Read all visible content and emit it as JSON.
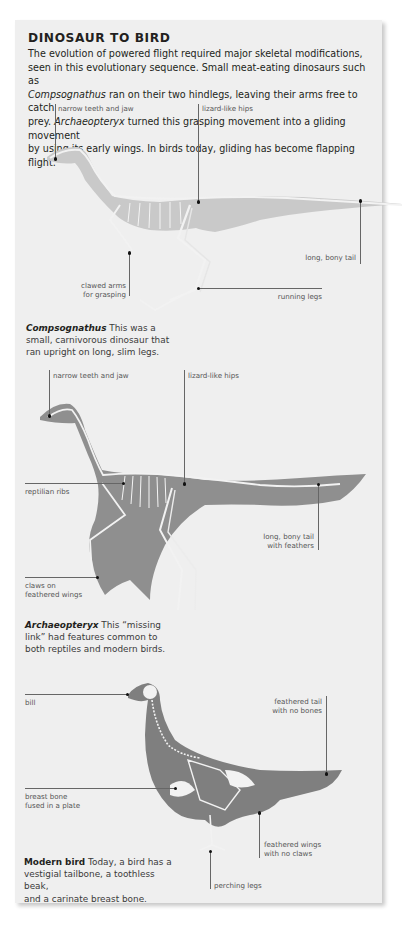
{
  "document": {
    "title": "DINOSAUR TO BIRD",
    "intro": {
      "line1": "The evolution of powered flight required major skeletal modifications,",
      "line2": "seen in this evolutionary sequence. Small meat-eating dinosaurs such as",
      "line3_italic": "Compsognathus",
      "line3_rest": " ran on their two hindlegs, leaving their arms free to catch",
      "line4_pre": "prey. ",
      "line4_italic": "Archaeopteryx",
      "line4_rest": " turned this grasping movement into a gliding movement",
      "line5": "by using its early wings. In birds today, gliding has become flapping flight."
    },
    "colors": {
      "panel_background": "#efefef",
      "compsognathus_body": "#c9c9c9",
      "archaeopteryx_body": "#8f8f8f",
      "modern_bird_body": "#7f7f7f",
      "bone": "#f2f2f2",
      "leader_line": "#666666"
    }
  },
  "compsognathus": {
    "labels": {
      "jaw": "narrow teeth and jaw",
      "hips": "lizard-like hips",
      "tail": "long, bony tail",
      "arms_1": "clawed arms",
      "arms_2": "for grasping",
      "legs": "running legs"
    },
    "caption": {
      "name": "Compsognathus",
      "line1_rest": " This was a",
      "line2": "small, carnivorous dinosaur that",
      "line3": "ran upright on long, slim legs."
    }
  },
  "archaeopteryx": {
    "labels": {
      "jaw": "narrow teeth and jaw",
      "hips": "lizard-like hips",
      "ribs": "reptilian ribs",
      "tail_1": "long, bony tail",
      "tail_2": "with feathers",
      "claws_1": "claws on",
      "claws_2": "feathered wings"
    },
    "caption": {
      "name": "Archaeopteryx",
      "line1_rest": " This “missing",
      "line2": "link” had features common to",
      "line3": "both reptiles and modern birds."
    }
  },
  "modern_bird": {
    "labels": {
      "bill": "bill",
      "tail_1": "feathered tail",
      "tail_2": "with no bones",
      "breast_1": "breast bone",
      "breast_2": "fused in a plate",
      "wings_1": "feathered wings",
      "wings_2": "with no claws",
      "legs": "perching legs"
    },
    "caption": {
      "name": "Modern bird",
      "line1_rest": " Today, a bird has a",
      "line2": "vestigial tailbone, a toothless beak,",
      "line3": "and a carinate breast bone."
    }
  }
}
